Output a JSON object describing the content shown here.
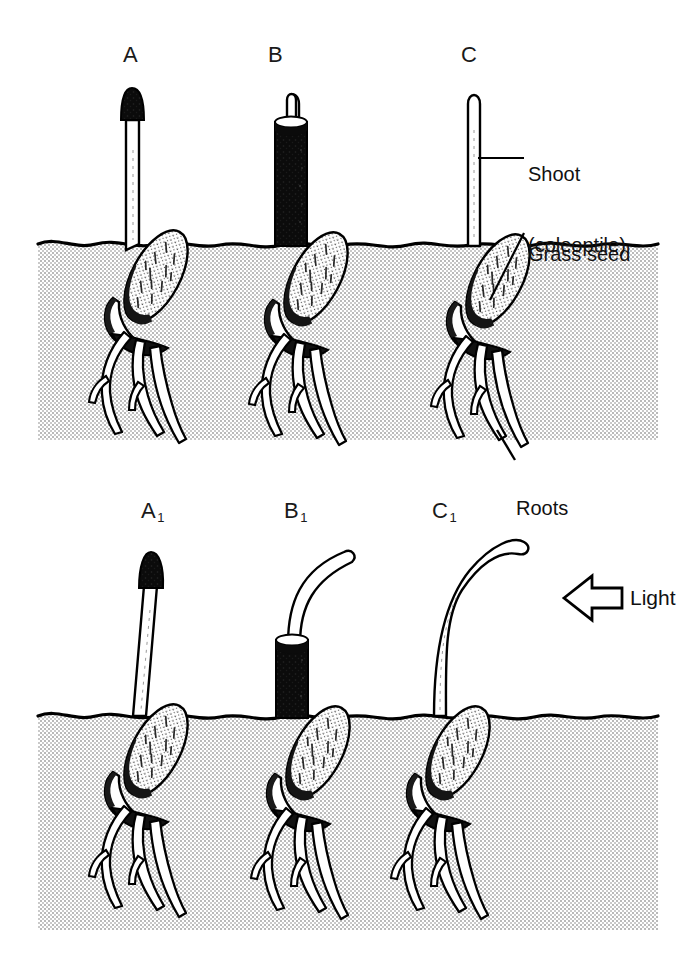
{
  "figure": {
    "background_color": "#ffffff",
    "ink_color": "#000000",
    "soil_fill_color": "#d9d9d9",
    "cap_color": "#0d0d0d"
  },
  "panels": [
    {
      "id": "top",
      "lighting": "uniform / none",
      "specimens": [
        {
          "label": "A",
          "label_sub": "",
          "treatment": "tip covered with opaque black cap",
          "shoot_state": "straight, vertical",
          "covering": "black-cap"
        },
        {
          "label": "B",
          "label_sub": "",
          "treatment": "shaft enclosed in opaque black tube, tip exposed",
          "shoot_state": "straight, vertical",
          "covering": "black-tube"
        },
        {
          "label": "C",
          "label_sub": "",
          "treatment": "uncovered control",
          "shoot_state": "straight, vertical",
          "covering": "none"
        }
      ]
    },
    {
      "id": "bottom",
      "lighting": "unidirectional light from the right",
      "specimens": [
        {
          "label": "A",
          "label_sub": "1",
          "treatment": "tip covered with opaque black cap",
          "shoot_state": "remains straight, no bending",
          "covering": "black-cap"
        },
        {
          "label": "B",
          "label_sub": "1",
          "treatment": "shaft enclosed in opaque black tube, tip exposed",
          "shoot_state": "exposed tip bends toward the light",
          "covering": "black-tube"
        },
        {
          "label": "C",
          "label_sub": "1",
          "treatment": "uncovered control",
          "shoot_state": "bends strongly toward the light",
          "covering": "none"
        }
      ]
    }
  ],
  "callouts": [
    {
      "name": "shoot",
      "line1": "Shoot",
      "line2": "(coleoptile)",
      "points_to": "upper part of coleoptile of specimen C"
    },
    {
      "name": "grass-seed",
      "line1": "Grass seed",
      "line2": "",
      "points_to": "seed of specimen C below soil line"
    },
    {
      "name": "roots",
      "line1": "Roots",
      "line2": "",
      "points_to": "root tips of specimen C"
    }
  ],
  "light_indicator": {
    "label": "Light",
    "direction": "left",
    "arrow_style": "hollow outlined block arrow"
  }
}
